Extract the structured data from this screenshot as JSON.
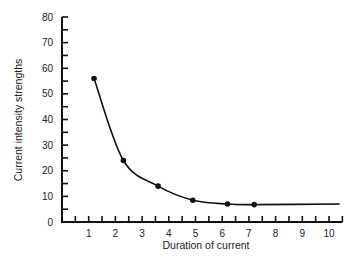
{
  "chart_data": {
    "type": "line",
    "title": "",
    "xlabel": "Duration of current",
    "ylabel": "Current intensity strengths",
    "xlim": [
      0,
      10.5
    ],
    "ylim": [
      0,
      80
    ],
    "x_ticks": [
      1,
      2,
      3,
      4,
      5,
      6,
      7,
      8,
      9,
      10
    ],
    "x_minor_step": 0.5,
    "y_ticks": [
      0,
      10,
      20,
      30,
      40,
      50,
      60,
      70,
      80
    ],
    "y_minor_step": 5,
    "grid": false,
    "legend": null,
    "series": [
      {
        "name": "strength-duration curve",
        "style": "smooth line with markers",
        "color": "#111111",
        "points": [
          {
            "x": 1.2,
            "y": 56
          },
          {
            "x": 2.3,
            "y": 24
          },
          {
            "x": 3.6,
            "y": 14
          },
          {
            "x": 4.9,
            "y": 8.5
          },
          {
            "x": 6.2,
            "y": 7
          },
          {
            "x": 7.2,
            "y": 6.8
          }
        ],
        "curve_end": {
          "x": 10.4,
          "y": 7
        }
      }
    ]
  }
}
